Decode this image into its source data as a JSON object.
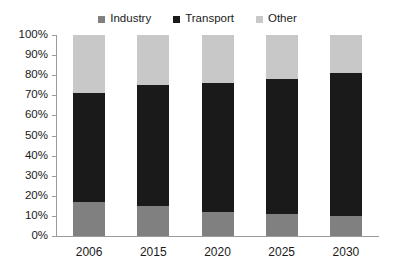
{
  "chart_data": {
    "type": "bar",
    "stacked": true,
    "normalized": true,
    "title": "",
    "subtitle": "",
    "xlabel": "",
    "ylabel": "",
    "categories": [
      "2006",
      "2015",
      "2020",
      "2025",
      "2030"
    ],
    "series": [
      {
        "name": "Industry",
        "color": "#808080",
        "values": [
          17,
          15,
          12,
          11,
          10
        ]
      },
      {
        "name": "Transport",
        "color": "#1a1a1a",
        "values": [
          54,
          60,
          64,
          67,
          71
        ]
      },
      {
        "name": "Other",
        "color": "#c8c8c8",
        "values": [
          29,
          25,
          24,
          22,
          19
        ]
      }
    ],
    "ylim": [
      0,
      100
    ],
    "y_tick_labels": [
      "100%",
      "90%",
      "80%",
      "70%",
      "60%",
      "50%",
      "40%",
      "30%",
      "20%",
      "10%",
      "0%"
    ],
    "y_tick_values": [
      100,
      90,
      80,
      70,
      60,
      50,
      40,
      30,
      20,
      10,
      0
    ],
    "grid": false,
    "legend_position": "top-center",
    "legend": [
      {
        "label": "Industry",
        "color": "#808080"
      },
      {
        "label": "Transport",
        "color": "#1a1a1a"
      },
      {
        "label": "Other",
        "color": "#c8c8c8"
      }
    ],
    "segment_tops_percent": [
      {
        "category": "2006",
        "industry_top": 17,
        "transport_top": 71,
        "other_top": 100
      },
      {
        "category": "2015",
        "industry_top": 15,
        "transport_top": 75,
        "other_top": 100
      },
      {
        "category": "2020",
        "industry_top": 12,
        "transport_top": 76,
        "other_top": 100
      },
      {
        "category": "2025",
        "industry_top": 11,
        "transport_top": 78,
        "other_top": 100
      },
      {
        "category": "2030",
        "industry_top": 10,
        "transport_top": 81,
        "other_top": 100
      }
    ],
    "colors": {
      "industry": "#808080",
      "transport": "#1a1a1a",
      "other": "#c8c8c8",
      "axis": "#9a9a9a",
      "background": "#ffffff",
      "text": "#1a1a1a"
    }
  }
}
